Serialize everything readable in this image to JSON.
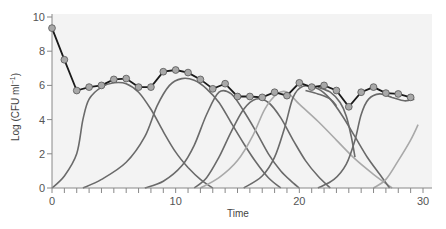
{
  "chart_data": {
    "type": "line",
    "title": "",
    "xlabel": "Time",
    "ylabel": "Log (CFU ml",
    "ylabel_superscript": "−1",
    "ylabel_close": ")",
    "xlim": [
      0,
      30
    ],
    "ylim": [
      0,
      10
    ],
    "x_ticks": [
      0,
      10,
      20,
      30
    ],
    "x_minor_step": 1,
    "y_ticks": [
      0,
      2,
      4,
      6,
      8,
      10
    ],
    "grid": false,
    "legend": null,
    "colors": {
      "background": "#f3f3f3",
      "total_line": "#1a1a1a",
      "marker_fill": "#a8a8a8",
      "marker_stroke": "#555555",
      "wave_dark": "#6a6a6a",
      "wave_light": "#a9a9a9",
      "axis": "#888888"
    },
    "total_population": {
      "name": "Total population (markers)",
      "x": [
        0,
        1,
        2,
        3,
        4,
        5,
        6,
        7,
        8,
        9,
        10,
        11,
        12,
        13,
        14,
        15,
        16,
        17,
        18,
        19,
        20,
        21,
        22,
        23,
        24,
        25,
        26,
        27,
        28,
        29
      ],
      "y": [
        9.35,
        7.5,
        5.7,
        5.9,
        6.0,
        6.35,
        6.4,
        5.9,
        5.9,
        6.8,
        6.9,
        6.75,
        6.35,
        5.8,
        6.1,
        5.35,
        5.35,
        5.3,
        5.6,
        5.4,
        6.15,
        5.9,
        6.0,
        5.7,
        4.75,
        5.6,
        5.9,
        5.55,
        5.5,
        5.3
      ]
    },
    "series": [
      {
        "name": "wave-1",
        "shade": "dark",
        "points": [
          [
            0,
            0
          ],
          [
            1,
            0.7
          ],
          [
            2,
            2.0
          ],
          [
            2.5,
            4.0
          ],
          [
            3,
            5.2
          ],
          [
            4,
            5.9
          ],
          [
            5,
            6.15
          ],
          [
            6,
            6.1
          ],
          [
            7,
            5.6
          ],
          [
            8,
            4.6
          ],
          [
            9,
            3.3
          ],
          [
            10,
            2.1
          ],
          [
            11,
            1.2
          ],
          [
            12,
            0.5
          ],
          [
            13,
            0
          ]
        ]
      },
      {
        "name": "wave-2",
        "shade": "dark",
        "points": [
          [
            2.5,
            0
          ],
          [
            4,
            0.5
          ],
          [
            6,
            1.5
          ],
          [
            7.5,
            3.0
          ],
          [
            8.5,
            4.8
          ],
          [
            9.5,
            6.0
          ],
          [
            10.5,
            6.4
          ],
          [
            11.5,
            6.3
          ],
          [
            12.5,
            5.8
          ],
          [
            13.5,
            5.0
          ],
          [
            14.5,
            3.8
          ],
          [
            15.5,
            2.6
          ],
          [
            16.5,
            1.5
          ],
          [
            17.5,
            0.6
          ],
          [
            18.5,
            0
          ]
        ]
      },
      {
        "name": "wave-3",
        "shade": "dark",
        "points": [
          [
            7.5,
            0
          ],
          [
            9,
            0.4
          ],
          [
            10.5,
            1.3
          ],
          [
            11.5,
            2.5
          ],
          [
            12.5,
            4.3
          ],
          [
            13.5,
            5.6
          ],
          [
            14.5,
            5.5
          ],
          [
            15.5,
            4.5
          ],
          [
            16.5,
            3.3
          ],
          [
            17.5,
            2.0
          ],
          [
            18.5,
            1.0
          ],
          [
            19.5,
            0.3
          ],
          [
            20,
            0
          ]
        ]
      },
      {
        "name": "wave-4",
        "shade": "dark",
        "points": [
          [
            11.5,
            0
          ],
          [
            12.5,
            0.6
          ],
          [
            13.5,
            1.8
          ],
          [
            14.5,
            3.3
          ],
          [
            15.5,
            4.6
          ],
          [
            16.5,
            5.2
          ],
          [
            17.5,
            5.0
          ],
          [
            18.5,
            4.1
          ],
          [
            19.5,
            2.8
          ],
          [
            20.5,
            1.6
          ],
          [
            21.5,
            0.7
          ],
          [
            22.5,
            0
          ]
        ]
      },
      {
        "name": "wave-5",
        "shade": "light",
        "points": [
          [
            12,
            0
          ],
          [
            13.5,
            0.6
          ],
          [
            15,
            1.6
          ],
          [
            16.2,
            3.0
          ],
          [
            17.2,
            4.6
          ],
          [
            18.2,
            5.5
          ],
          [
            19,
            5.6
          ],
          [
            20,
            4.9
          ],
          [
            21.5,
            3.9
          ],
          [
            23,
            2.8
          ],
          [
            24.5,
            1.7
          ],
          [
            26,
            0.8
          ],
          [
            27.5,
            0
          ]
        ]
      },
      {
        "name": "wave-6",
        "shade": "dark",
        "points": [
          [
            15.5,
            0
          ],
          [
            17,
            0.7
          ],
          [
            18,
            1.8
          ],
          [
            18.8,
            3.5
          ],
          [
            19.5,
            5.3
          ],
          [
            20.3,
            5.95
          ],
          [
            21.5,
            5.8
          ],
          [
            22.5,
            5.2
          ],
          [
            23.5,
            4.2
          ],
          [
            24.5,
            3.0
          ],
          [
            25.5,
            1.8
          ],
          [
            26.5,
            0.8
          ],
          [
            27.3,
            0
          ]
        ]
      },
      {
        "name": "wave-7",
        "shade": "dark",
        "points": [
          [
            21.5,
            0
          ],
          [
            22.8,
            0.5
          ],
          [
            23.8,
            1.4
          ],
          [
            24.5,
            2.8
          ],
          [
            25,
            4.3
          ],
          [
            25.6,
            5.2
          ],
          [
            26.5,
            5.5
          ],
          [
            27.5,
            5.3
          ],
          [
            28.5,
            5.1
          ],
          [
            29.3,
            5.2
          ]
        ]
      },
      {
        "name": "wave-8",
        "shade": "light",
        "points": [
          [
            26,
            0
          ],
          [
            27,
            0.5
          ],
          [
            28,
            1.6
          ],
          [
            29,
            2.8
          ],
          [
            29.6,
            3.7
          ]
        ]
      },
      {
        "name": "wave-dip",
        "shade": "dark",
        "points": [
          [
            21.5,
            5.9
          ],
          [
            22.5,
            5.6
          ],
          [
            23.3,
            5.0
          ],
          [
            23.8,
            4.2
          ],
          [
            24.2,
            3.0
          ],
          [
            24.5,
            1.8
          ]
        ]
      },
      {
        "name": "decay-tail",
        "shade": "dark",
        "points": [
          [
            20.5,
            5.7
          ],
          [
            21.5,
            5.5
          ],
          [
            22.5,
            5.2
          ],
          [
            23,
            4.8
          ]
        ]
      }
    ]
  }
}
